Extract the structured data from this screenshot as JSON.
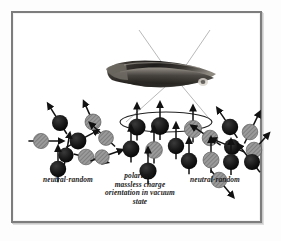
{
  "figure": {
    "background_color": "#ffffff",
    "frame_color": "#7d7d7d"
  },
  "captions": {
    "left": "neutral-random",
    "center": "polarized-\nmassless charge\norientation in vacuum\nstate",
    "center_lines": [
      "polarized-",
      "massless charge",
      "orientation in vacuum",
      "state"
    ],
    "right": "neutral-random"
  },
  "colors": {
    "sphere_dark": "#161616",
    "sphere_light": "#9a9a9a",
    "sphere_light_stripe": "#6e6e6e",
    "arrow": "#111111",
    "ray_line": "#a6a6a6",
    "ellipse": "#222222",
    "photo_dark": "#2a2a2a",
    "photo_mid": "#6b6b6b",
    "photo_light": "#b8b8b8"
  },
  "photo_object": {
    "name": "dark-elongated-photographic-object",
    "x": 90,
    "y": 42,
    "width": 115,
    "height": 40
  },
  "rays": {
    "name": "converging-diverging-ray-lines",
    "color": "#a6a6a6",
    "upper": [
      {
        "x1": 125,
        "y1": 16,
        "x2": 160,
        "y2": 66
      },
      {
        "x1": 196,
        "y1": 16,
        "x2": 162,
        "y2": 66
      }
    ],
    "lower": [
      {
        "x1": 152,
        "y1": 72,
        "x2": 112,
        "y2": 108
      },
      {
        "x1": 168,
        "y1": 72,
        "x2": 198,
        "y2": 108
      }
    ]
  },
  "ellipse": {
    "name": "polarization-ellipse",
    "cx": 152,
    "cy": 108,
    "rx": 46,
    "ry": 10
  },
  "clusters": [
    {
      "id": "left-cluster",
      "label": "neutral-random",
      "polarized": false,
      "particles": [
        {
          "cx": 46,
          "cy": 109,
          "r": 8.0,
          "shade": "dark",
          "angle": -32
        },
        {
          "cx": 27,
          "cy": 127,
          "r": 7.6,
          "shade": "light",
          "angle": 90
        },
        {
          "cx": 64,
          "cy": 127,
          "r": 8.4,
          "shade": "dark",
          "angle": 62
        },
        {
          "cx": 79,
          "cy": 108,
          "r": 8.0,
          "shade": "light",
          "angle": -24
        },
        {
          "cx": 92,
          "cy": 124,
          "r": 7.4,
          "shade": "light",
          "angle": -47
        },
        {
          "cx": 52,
          "cy": 141,
          "r": 7.6,
          "shade": "dark",
          "angle": 10
        },
        {
          "cx": 72,
          "cy": 143,
          "r": 7.8,
          "shade": "light",
          "angle": 104
        },
        {
          "cx": 88,
          "cy": 143,
          "r": 7.2,
          "shade": "light",
          "angle": 71
        },
        {
          "cx": 44,
          "cy": 155,
          "r": 8.2,
          "shade": "dark",
          "angle": 0
        }
      ]
    },
    {
      "id": "center-cluster",
      "label": "polarized-massless charge orientation in vacuum state",
      "polarized": true,
      "particles": [
        {
          "cx": 123,
          "cy": 113,
          "r": 8.6,
          "shade": "dark",
          "angle": 0
        },
        {
          "cx": 146,
          "cy": 112,
          "r": 9.0,
          "shade": "dark",
          "angle": 0
        },
        {
          "cx": 179,
          "cy": 115,
          "r": 8.6,
          "shade": "light",
          "angle": 0
        },
        {
          "cx": 117,
          "cy": 135,
          "r": 8.4,
          "shade": "dark",
          "angle": 0
        },
        {
          "cx": 140,
          "cy": 136,
          "r": 8.4,
          "shade": "light",
          "angle": 0
        },
        {
          "cx": 162,
          "cy": 132,
          "r": 8.2,
          "shade": "dark",
          "angle": 0
        },
        {
          "cx": 175,
          "cy": 147,
          "r": 8.2,
          "shade": "dark",
          "angle": 0
        },
        {
          "cx": 134,
          "cy": 157,
          "r": 8.6,
          "shade": "dark",
          "angle": 0
        }
      ]
    },
    {
      "id": "right-cluster",
      "label": "neutral-random",
      "polarized": false,
      "particles": [
        {
          "cx": 216,
          "cy": 113,
          "r": 8.2,
          "shade": "dark",
          "angle": -34
        },
        {
          "cx": 236,
          "cy": 118,
          "r": 7.8,
          "shade": "light",
          "angle": 26
        },
        {
          "cx": 196,
          "cy": 124,
          "r": 7.8,
          "shade": "light",
          "angle": -56
        },
        {
          "cx": 218,
          "cy": 133,
          "r": 8.0,
          "shade": "dark",
          "angle": -68
        },
        {
          "cx": 240,
          "cy": 136,
          "r": 7.8,
          "shade": "light",
          "angle": 42
        },
        {
          "cx": 197,
          "cy": 146,
          "r": 8.0,
          "shade": "light",
          "angle": 0
        },
        {
          "cx": 217,
          "cy": 148,
          "r": 8.0,
          "shade": "dark",
          "angle": 0
        },
        {
          "cx": 238,
          "cy": 148,
          "r": 8.0,
          "shade": "dark",
          "angle": -38
        },
        {
          "cx": 205,
          "cy": 166,
          "r": 7.8,
          "shade": "light",
          "angle": 140
        }
      ]
    }
  ]
}
